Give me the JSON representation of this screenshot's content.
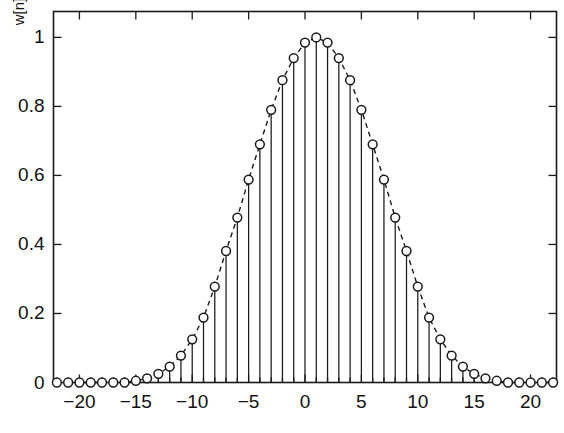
{
  "chart_data": {
    "type": "line",
    "title": "",
    "xlabel": "",
    "ylabel": "w[n]",
    "xlim": [
      -22.3,
      22.3
    ],
    "ylim": [
      0,
      1.075
    ],
    "grid": false,
    "legend": null,
    "marker": "circle-open",
    "linestyle": "dashed",
    "stems": true,
    "xticks": [
      -20,
      -15,
      -10,
      -5,
      0,
      5,
      10,
      15,
      20
    ],
    "xtick_labels": [
      "−20",
      "−15",
      "−10",
      "−5",
      "0",
      "5",
      "10",
      "15",
      "20"
    ],
    "yticks": [
      0,
      0.2,
      0.4,
      0.6,
      0.8,
      1
    ],
    "ytick_labels": [
      "0",
      "0.2",
      "0.4",
      "0.6",
      "0.8",
      "1"
    ],
    "x": [
      -22,
      -21,
      -20,
      -19,
      -18,
      -17,
      -16,
      -15,
      -14,
      -13,
      -12,
      -11,
      -10,
      -9,
      -8,
      -7,
      -6,
      -5,
      -4,
      -3,
      -2,
      -1,
      0,
      1,
      2,
      3,
      4,
      5,
      6,
      7,
      8,
      9,
      10,
      11,
      12,
      13,
      14,
      15,
      16,
      17,
      18,
      19,
      20,
      21,
      22
    ],
    "values": [
      0.0,
      0.0,
      0.0,
      0.0,
      0.0,
      0.0,
      0.0,
      0.005,
      0.012,
      0.025,
      0.046,
      0.078,
      0.125,
      0.188,
      0.278,
      0.381,
      0.478,
      0.588,
      0.69,
      0.79,
      0.876,
      0.94,
      0.985,
      1.0,
      0.985,
      0.94,
      0.876,
      0.79,
      0.69,
      0.588,
      0.478,
      0.381,
      0.278,
      0.188,
      0.125,
      0.078,
      0.046,
      0.025,
      0.012,
      0.005,
      0.0,
      0.0,
      0.0,
      0.0,
      0.0
    ]
  },
  "axes": {
    "ylabel": "w[n]",
    "ytick_labels": [
      "1",
      "0.8",
      "0.6",
      "0.4",
      "0.2",
      "0"
    ],
    "xtick_labels": [
      "−20",
      "−15",
      "−10",
      "−5",
      "0",
      "5",
      "10",
      "15",
      "20"
    ]
  },
  "style": {
    "axis_color": "#1a1a1a",
    "line_color": "#1a1a1a",
    "marker_fill": "#ffffff",
    "background": "#ffffff"
  }
}
